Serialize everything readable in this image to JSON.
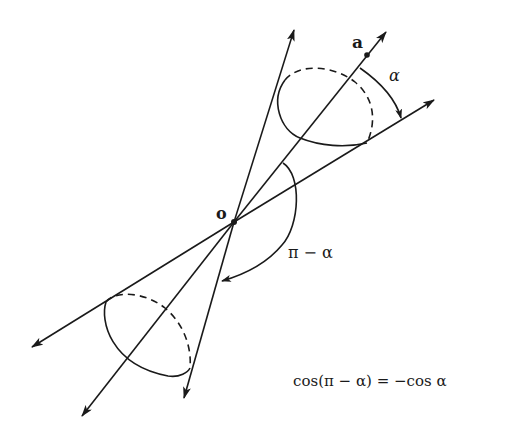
{
  "figure": {
    "labels": {
      "point_a": "a",
      "origin": "o",
      "angle_alpha": "α",
      "angle_pi_minus_alpha": "π − α",
      "identity": "cos(π − α) = −cos α"
    },
    "colors": {
      "stroke": "#1a1a1a",
      "background": "#ffffff"
    },
    "elements": [
      "axis line through o toward point a (both directions arrowed)",
      "upper cone generator lines with elliptical base (dashed back half)",
      "lower mirrored cone with elliptical base (dashed back half)",
      "arc labeled alpha between axis and generator",
      "arc labeled pi minus alpha from upper generator to lower generator"
    ]
  }
}
